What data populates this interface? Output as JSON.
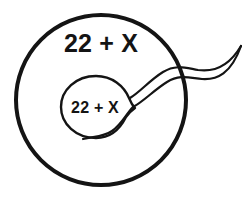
{
  "diagram": {
    "background_color": "#ffffff",
    "stroke_color": "#141414",
    "fill_color": "#ffffff",
    "egg_cell": {
      "shape": "circle",
      "label": "22 + X",
      "center_x": 101,
      "center_y": 100,
      "radius": 85,
      "stroke_width": 4,
      "label_x": 101,
      "label_y": 52
    },
    "sperm_cell": {
      "shape": "teardrop-with-flagellum",
      "label": "22 + X",
      "head_center_x": 96,
      "head_center_y": 107,
      "stroke_width": 2.4,
      "label_x": 95,
      "label_y": 113,
      "tail_tip_x": 242,
      "tail_tip_y": 45
    }
  }
}
